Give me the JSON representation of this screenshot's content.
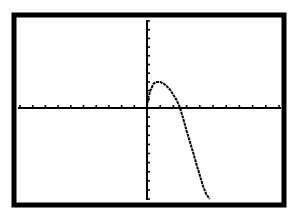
{
  "screen": {
    "type": "graphing-calculator-display",
    "background": "#ffffff",
    "ink": "#000000"
  },
  "chart_data": {
    "type": "line",
    "title": "",
    "xlabel": "",
    "ylabel": "",
    "xlim": [
      -10,
      10
    ],
    "ylim": [
      -10,
      10
    ],
    "xscale": 1,
    "yscale": 1,
    "grid": false,
    "axes": true,
    "x_ticks_each_side": 10,
    "y_ticks_each_side": 10,
    "series": [
      {
        "name": "Y1",
        "x": [
          0,
          0.1,
          0.25,
          0.5,
          0.75,
          1.0,
          1.25,
          1.5,
          1.75,
          2.0,
          2.25,
          2.5,
          2.75,
          3.0,
          3.25,
          3.5,
          3.75,
          4.0,
          4.25,
          4.5,
          4.75
        ],
        "y": [
          0.2,
          1.2,
          2.0,
          2.8,
          3.0,
          3.0,
          2.8,
          2.5,
          2.1,
          1.5,
          0.9,
          0.0,
          -1.2,
          -2.5,
          -3.7,
          -4.9,
          -6.2,
          -7.4,
          -8.6,
          -9.5,
          -10.0
        ]
      }
    ]
  }
}
